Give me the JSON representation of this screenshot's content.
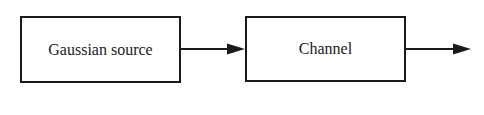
{
  "diagram": {
    "type": "block-diagram",
    "blocks": [
      {
        "id": "gaussian-source",
        "label": "Gaussian source"
      },
      {
        "id": "channel",
        "label": "Channel"
      }
    ],
    "edges": [
      {
        "from": "gaussian-source",
        "to": "channel",
        "label": ""
      },
      {
        "from": "channel",
        "to": "output",
        "label": ""
      }
    ],
    "colors": {
      "stroke": "#1a1a1a",
      "background": "#ffffff"
    }
  }
}
